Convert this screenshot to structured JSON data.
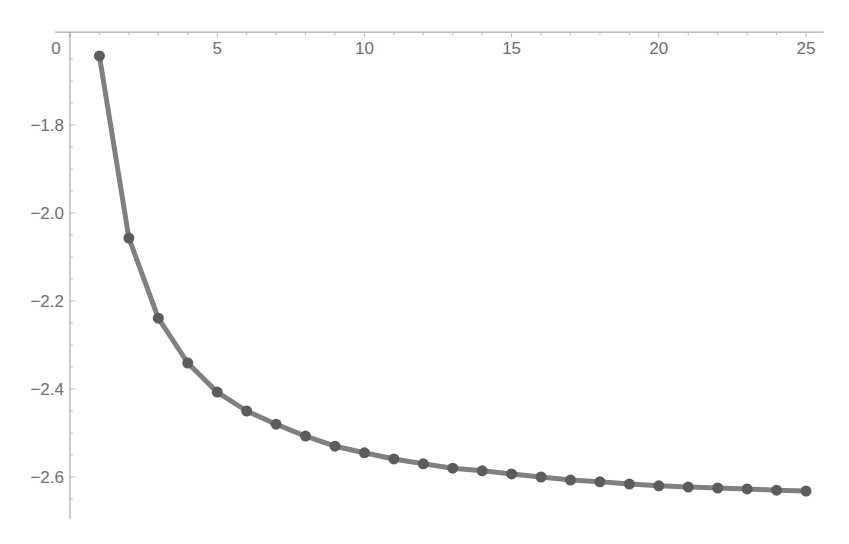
{
  "chart_data": {
    "type": "line",
    "title": "",
    "xlabel": "",
    "ylabel": "",
    "x_axis_position": "top",
    "x_ticks": [
      0,
      5,
      10,
      15,
      20,
      25
    ],
    "x_tick_labels": [
      "0",
      "5",
      "10",
      "15",
      "20",
      "25"
    ],
    "y_ticks": [
      -1.8,
      -2.0,
      -2.2,
      -2.4,
      -2.6
    ],
    "y_tick_labels": [
      "-1.8",
      "-2.0",
      "-2.2",
      "-2.4",
      "-2.6"
    ],
    "xlim": [
      0,
      25.5
    ],
    "ylim": [
      -2.695,
      -1.589
    ],
    "grid": false,
    "legend": null,
    "markers": true,
    "series": [
      {
        "name": "series-1",
        "color": "#808080",
        "marker_color": "#5c5c5c",
        "x": [
          1,
          2,
          3,
          4,
          5,
          6,
          7,
          8,
          9,
          10,
          11,
          12,
          13,
          14,
          15,
          16,
          17,
          18,
          19,
          20,
          21,
          22,
          23,
          24,
          25
        ],
        "values": [
          -1.643,
          -2.057,
          -2.239,
          -2.341,
          -2.407,
          -2.45,
          -2.48,
          -2.507,
          -2.53,
          -2.545,
          -2.559,
          -2.57,
          -2.58,
          -2.586,
          -2.593,
          -2.6,
          -2.607,
          -2.611,
          -2.616,
          -2.62,
          -2.623,
          -2.625,
          -2.627,
          -2.63,
          -2.632
        ]
      }
    ]
  }
}
